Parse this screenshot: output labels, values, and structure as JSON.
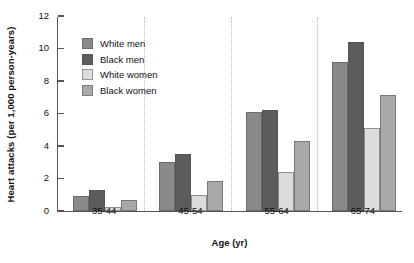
{
  "chart_data": {
    "type": "bar",
    "title": "",
    "xlabel": "Age (yr)",
    "ylabel": "Heart attacks (per 1,000 person-years)",
    "categories": [
      "35-44",
      "45-54",
      "55-64",
      "65-74"
    ],
    "series": [
      {
        "name": "White men",
        "color": "#8a8a8a",
        "values": [
          0.95,
          3.0,
          6.1,
          9.2
        ]
      },
      {
        "name": "Black men",
        "color": "#5c5c5c",
        "values": [
          1.3,
          3.5,
          6.2,
          10.4
        ]
      },
      {
        "name": "White women",
        "color": "#dcdcdc",
        "values": [
          0.25,
          1.0,
          2.4,
          5.1
        ]
      },
      {
        "name": "Black women",
        "color": "#a9a9a9",
        "values": [
          0.65,
          1.85,
          4.3,
          7.15
        ]
      }
    ],
    "ylim": [
      0,
      12
    ],
    "yticks": [
      0,
      2,
      4,
      6,
      8,
      10,
      12
    ],
    "grid": false,
    "group_separators": true,
    "legend_position": "upper-left-inside"
  }
}
